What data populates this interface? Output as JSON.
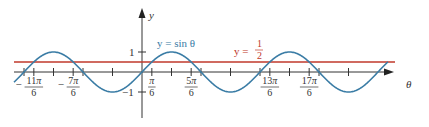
{
  "chart_data": {
    "type": "line",
    "title": "",
    "xlabel": "θ",
    "ylabel": "y",
    "series": [
      {
        "name": "y = sin θ",
        "function": "sin",
        "color": "#3a7ca5"
      },
      {
        "name": "y = 1/2",
        "function": "constant",
        "value": 0.5,
        "color": "#c0392b"
      }
    ],
    "x_range_radians": [
      -2.0,
      3.6
    ],
    "ylim": [
      -1.2,
      1.3
    ],
    "y_ticks": [
      {
        "value": 1,
        "label": "1"
      },
      {
        "value": -1,
        "label": "−1"
      }
    ],
    "x_tick_labels": [
      {
        "value_pi": -1.8333,
        "num": "−11π",
        "den": "6"
      },
      {
        "value_pi": -1.1667,
        "num": "−7π",
        "den": "6"
      },
      {
        "value_pi": 0.1667,
        "num": "π",
        "den": "6"
      },
      {
        "value_pi": 0.8333,
        "num": "5π",
        "den": "6"
      },
      {
        "value_pi": 2.1667,
        "num": "13π",
        "den": "6"
      },
      {
        "value_pi": 2.8333,
        "num": "17π",
        "den": "6"
      }
    ],
    "unlabeled_ticks_pi": [
      -2,
      -1.5,
      -1,
      -0.5,
      0.5,
      1,
      1.5,
      2,
      2.5,
      3,
      3.5
    ],
    "annotations": [
      {
        "text": "y = sin θ",
        "color": "#3a7ca5"
      },
      {
        "text": "y = 1/2",
        "color": "#c0392b"
      }
    ],
    "grid": false,
    "legend": "inline labels"
  },
  "labels": {
    "y_axis": "y",
    "x_axis": "θ",
    "sin_label": "y = sin θ",
    "half_label_prefix": "y =",
    "half_num": "1",
    "half_den": "2",
    "tick_one": "1",
    "tick_neg_one": "−1"
  },
  "colors": {
    "sine": "#3a7ca5",
    "half": "#c0392b",
    "axis": "#333333"
  }
}
